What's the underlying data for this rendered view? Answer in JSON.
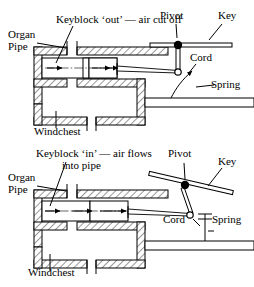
{
  "figure": {
    "title_semantic": "organ-keyblock-mechanism",
    "ink_color": "#000000",
    "background_color": "#ffffff"
  },
  "panels": [
    {
      "id": "keyblock-out",
      "state": "out",
      "caption": "Keyblock ‘out’ — air cut off",
      "labels": {
        "organ": "Organ",
        "pipe": "Pipe",
        "windchest": "Windchest",
        "pivot": "Pivot",
        "key": "Key",
        "cord": "Cord",
        "spring": "Spring"
      },
      "key_position": "horizontal-rest",
      "spring_shape": "curved",
      "airflow": "blocked"
    },
    {
      "id": "keyblock-in",
      "state": "in",
      "caption_line1": "Keyblock ‘in’ — air flows",
      "caption_line2": "into pipe",
      "labels": {
        "organ": "Organ",
        "pipe": "Pipe",
        "windchest": "Windchest",
        "pivot": "Pivot",
        "key": "Key",
        "cord": "Cord",
        "spring": "Spring"
      },
      "key_position": "tilted-depressed",
      "spring_shape": "straight-stretched",
      "airflow": "open"
    }
  ]
}
